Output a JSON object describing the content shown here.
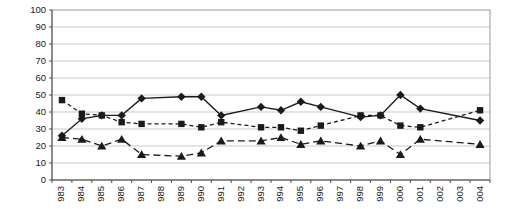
{
  "chart_data": {
    "type": "line",
    "title": "",
    "xlabel": "",
    "ylabel": "",
    "ylim": [
      0,
      100
    ],
    "ytick_step": 10,
    "ytick_labels": [
      "0",
      "10",
      "20",
      "30",
      "40",
      "50",
      "60",
      "70",
      "80",
      "90",
      "100"
    ],
    "grid": true,
    "legend_position": "none",
    "categories": [
      "983",
      "984",
      "985",
      "986",
      "987",
      "988",
      "989",
      "990",
      "991",
      "992",
      "993",
      "994",
      "995",
      "996",
      "997",
      "998",
      "999",
      "000",
      "001",
      "002",
      "003",
      "004"
    ],
    "note_missing_years": "no data points at 988, 992, 997, 002, 003 - lines interpolate across them",
    "series": [
      {
        "name": "diamond-series",
        "marker": "diamond",
        "line_style": "solid",
        "points": [
          [
            "983",
            26
          ],
          [
            "984",
            36
          ],
          [
            "985",
            38
          ],
          [
            "986",
            38
          ],
          [
            "987",
            48
          ],
          [
            "989",
            49
          ],
          [
            "990",
            49
          ],
          [
            "991",
            38
          ],
          [
            "993",
            43
          ],
          [
            "994",
            41
          ],
          [
            "995",
            46
          ],
          [
            "996",
            43
          ],
          [
            "998",
            37
          ],
          [
            "999",
            38
          ],
          [
            "000",
            50
          ],
          [
            "001",
            42
          ],
          [
            "004",
            35
          ]
        ]
      },
      {
        "name": "square-series",
        "marker": "square",
        "line_style": "dashed",
        "points": [
          [
            "983",
            47
          ],
          [
            "984",
            39
          ],
          [
            "985",
            38
          ],
          [
            "986",
            34
          ],
          [
            "987",
            33
          ],
          [
            "989",
            33
          ],
          [
            "990",
            31
          ],
          [
            "991",
            34
          ],
          [
            "993",
            31
          ],
          [
            "994",
            31
          ],
          [
            "995",
            29
          ],
          [
            "996",
            32
          ],
          [
            "998",
            38
          ],
          [
            "999",
            38
          ],
          [
            "000",
            32
          ],
          [
            "001",
            31
          ],
          [
            "004",
            41
          ]
        ]
      },
      {
        "name": "triangle-series",
        "marker": "triangle",
        "line_style": "long-dash",
        "points": [
          [
            "983",
            25
          ],
          [
            "984",
            24
          ],
          [
            "985",
            20
          ],
          [
            "986",
            24
          ],
          [
            "987",
            15
          ],
          [
            "989",
            14
          ],
          [
            "990",
            16
          ],
          [
            "991",
            23
          ],
          [
            "993",
            23
          ],
          [
            "994",
            25
          ],
          [
            "995",
            21
          ],
          [
            "996",
            23
          ],
          [
            "998",
            20
          ],
          [
            "999",
            23
          ],
          [
            "000",
            15
          ],
          [
            "001",
            24
          ],
          [
            "004",
            21
          ]
        ]
      }
    ],
    "colors": {
      "series_color": "#1a1a1a",
      "grid_color": "#c9c9c9",
      "plot_border_color": "#999999",
      "axis_color": "#4d4d4d",
      "background": "#ffffff"
    },
    "layout": {
      "plot_left": 52,
      "plot_top": 10,
      "plot_right": 490,
      "plot_bottom": 180
    }
  }
}
